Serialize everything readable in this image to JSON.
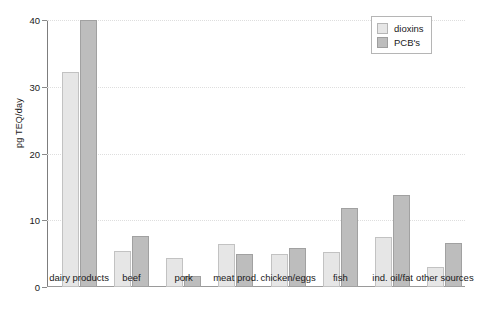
{
  "chart_data": {
    "type": "bar",
    "title": "",
    "subtitle": "",
    "xlabel": "",
    "ylabel": "pg TEQ/day",
    "ylim": [
      0,
      40
    ],
    "yticks": [
      0,
      10,
      20,
      30,
      40
    ],
    "ytick_labels": [
      "0",
      "10",
      "20",
      "30",
      "40"
    ],
    "grid": "horizontal-dotted",
    "legend_position": "top-right",
    "categories": [
      "dairy products",
      "beef",
      "pork",
      "meat prod.",
      "chicken/eggs",
      "fish",
      "ind. oil/fat",
      "other sources"
    ],
    "series": [
      {
        "name": "dioxins",
        "color": "#e6e6e6",
        "values": [
          32.2,
          5.4,
          4.4,
          6.4,
          5.0,
          5.3,
          7.5,
          3.0
        ]
      },
      {
        "name": "PCB's",
        "color": "#bdbdbd",
        "values": [
          40.0,
          7.7,
          1.6,
          5.0,
          5.9,
          11.8,
          13.8,
          6.6
        ]
      }
    ]
  },
  "legend": {
    "items": [
      {
        "label": "dioxins",
        "swatch": "dioxins"
      },
      {
        "label": "PCB's",
        "swatch": "pcb"
      }
    ]
  }
}
